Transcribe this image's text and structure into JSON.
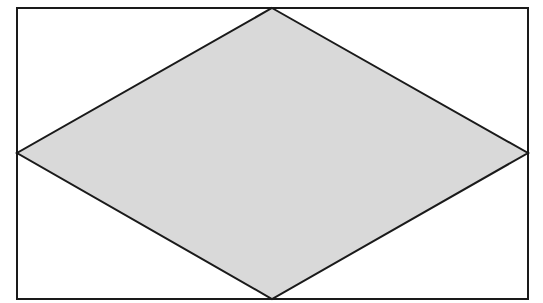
{
  "diagram": {
    "type": "rhombus-inscribed-in-rectangle",
    "canvas": {
      "width": 543,
      "height": 303
    },
    "rectangle": {
      "x": 17,
      "y": 8,
      "width": 511,
      "height": 291,
      "fill": "#ffffff",
      "stroke": "#1a1a1a",
      "stroke_width": 2
    },
    "rhombus": {
      "points": "272,8 528,153 272,299 17,153",
      "fill": "#d9d9d9",
      "stroke": "#1a1a1a",
      "stroke_width": 2
    }
  }
}
